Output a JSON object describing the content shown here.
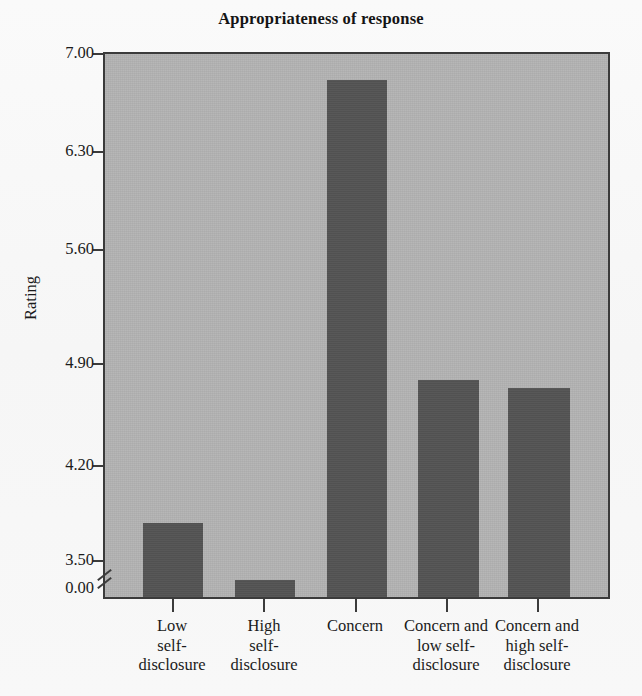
{
  "chart_data": {
    "type": "bar",
    "title": "Appropriateness of response",
    "xlabel": "",
    "ylabel": "Rating",
    "categories": [
      "Low self-disclosure",
      "High self-disclosure",
      "Concern",
      "Concern and low self-disclosure",
      "Concern and high self-disclosure"
    ],
    "category_lines": [
      [
        "Low",
        "self-",
        "disclosure"
      ],
      [
        "High",
        "self-",
        "disclosure"
      ],
      [
        "Concern"
      ],
      [
        "Concern and",
        "low self-",
        "disclosure"
      ],
      [
        "Concern and",
        "high self-",
        "disclosure"
      ]
    ],
    "values": [
      3.98,
      3.61,
      6.83,
      4.9,
      4.85
    ],
    "ylim": [
      3.5,
      7.0
    ],
    "y_axis_break": true,
    "y_break_from": 0.0,
    "y_break_to": 3.5,
    "yticks": [
      "7.00",
      "6.30",
      "5.60",
      "4.90",
      "4.20",
      "3.50",
      "0.00"
    ],
    "ytick_values": [
      7.0,
      6.3,
      5.6,
      4.9,
      4.2,
      3.5,
      0.0
    ],
    "grid": false,
    "legend": null,
    "colors": {
      "bar_fill": "#545454",
      "plot_background": "#b2b2b2",
      "axis": "#3b3b3b",
      "text": "#1b1b1b",
      "page_background": "#fbfbfb"
    }
  }
}
